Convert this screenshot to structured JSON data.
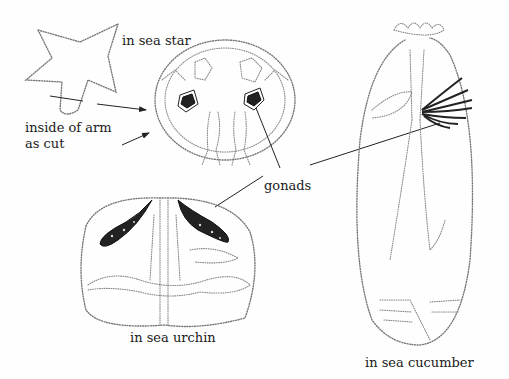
{
  "diagram": {
    "title": "",
    "labels": {
      "sea_star": "in sea star",
      "arm_cut_line1": "inside of arm",
      "arm_cut_line2": "as cut",
      "gonads": "gonads",
      "sea_urchin": "in sea urchin",
      "sea_cucumber": "in sea cucumber"
    },
    "panels": [
      {
        "id": "sea-star",
        "caption": "in sea star",
        "parts": [
          "whole sea star outline",
          "arm cross-section",
          "gonads"
        ]
      },
      {
        "id": "sea-urchin",
        "caption": "in sea urchin",
        "parts": [
          "test outline",
          "gonads",
          "intestine"
        ]
      },
      {
        "id": "sea-cucumber",
        "caption": "in sea cucumber",
        "parts": [
          "tentacle crown",
          "body outline",
          "gonad tubules"
        ]
      }
    ],
    "colors": {
      "stipple": "#777777",
      "ink": "#222222",
      "background": "#fefefe"
    }
  }
}
